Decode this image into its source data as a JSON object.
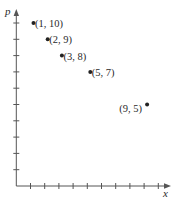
{
  "chart_data": {
    "type": "scatter",
    "title": "",
    "xlabel": "x",
    "ylabel": "p",
    "xlim": [
      0,
      10
    ],
    "ylim": [
      0,
      10
    ],
    "x_ticks": [
      1,
      2,
      3,
      4,
      5,
      6,
      7,
      8,
      9,
      10
    ],
    "y_ticks": [
      1,
      2,
      3,
      4,
      5,
      6,
      7,
      8,
      9,
      10
    ],
    "tick_labels_shown": false,
    "grid": false,
    "legend": null,
    "series": [
      {
        "name": "points",
        "points": [
          {
            "x": 1,
            "y": 10,
            "label": "(1, 10)",
            "label_side": "right"
          },
          {
            "x": 2,
            "y": 9,
            "label": "(2, 9)",
            "label_side": "right"
          },
          {
            "x": 3,
            "y": 8,
            "label": "(3, 8)",
            "label_side": "right"
          },
          {
            "x": 5,
            "y": 7,
            "label": "(5, 7)",
            "label_side": "right"
          },
          {
            "x": 9,
            "y": 5,
            "label": "(9, 5)",
            "label_side": "left"
          }
        ]
      }
    ]
  },
  "axes": {
    "x_label": "x",
    "y_label": "p"
  },
  "colors": {
    "axis": "#555555",
    "marker": "#222222",
    "text": "#2a2a2a",
    "background": "#ffffff"
  }
}
